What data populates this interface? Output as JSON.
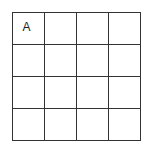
{
  "grid": {
    "rows": 4,
    "cols": 4,
    "cells": [
      [
        "A",
        "",
        "",
        ""
      ],
      [
        "",
        "",
        "",
        ""
      ],
      [
        "",
        "",
        "",
        ""
      ],
      [
        "",
        "",
        "",
        ""
      ]
    ]
  }
}
